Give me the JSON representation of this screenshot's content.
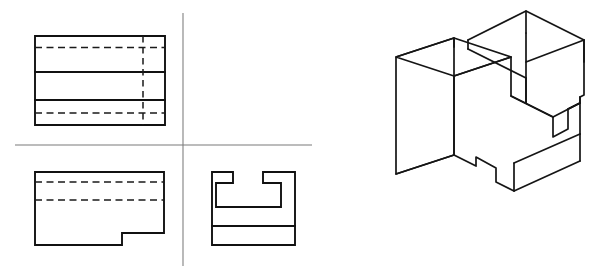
{
  "sheet": {
    "title": "Orthographic Multiview Drawing with Isometric Pictorial",
    "width": 601,
    "height": 278,
    "background_color": "#ffffff",
    "object_line_color": "#111111",
    "hidden_line_color": "#1a1a1a",
    "center_line_color": "#7b7b7b"
  },
  "projection_axes": {
    "name": "quadrant-divider",
    "horizontal": {
      "x1": 15,
      "y1": 145,
      "x2": 312,
      "y2": 145
    },
    "vertical": {
      "x1": 183,
      "y1": 13,
      "x2": 183,
      "y2": 266
    }
  },
  "views": {
    "top_view": {
      "label": "Top View",
      "outline": "M35,36 L165,36 L165,125 L35,125 Z",
      "object_lines": [
        "M35,72 L165,72",
        "M35,100 L165,100"
      ],
      "hidden_lines": [
        "M35,47.5 L165,47.5",
        "M35,113 L165,113"
      ],
      "hidden_lines_vertical": [
        "M143,36 L143,125"
      ],
      "bounds": {
        "x": 35,
        "y": 36,
        "width": 130,
        "height": 89
      }
    },
    "front_view": {
      "label": "Front View",
      "outline": "M35,172 L164,172 L164,233 L122,233 L122,245 L35,245 Z",
      "object_lines": [],
      "hidden_lines": [
        "M35,182 L164,182",
        "M35,200 L164,200"
      ],
      "hidden_lines_vertical": [],
      "bounds": {
        "x": 35,
        "y": 172,
        "width": 129,
        "height": 73
      }
    },
    "side_view": {
      "label": "Right Side View",
      "outline": "M212,172 L233,172 L233,183 L216,183 L216,207 L281,207 L281,183 L263,183 L263,172 L295,172 L295,245 L212,245 Z",
      "object_lines": [
        "M212,226 L295,226"
      ],
      "hidden_lines": [],
      "hidden_lines_vertical": [],
      "bounds": {
        "x": 212,
        "y": 172,
        "width": 83,
        "height": 73
      }
    },
    "isometric_view": {
      "label": "Isometric Pictorial View",
      "bounds": {
        "x": 396,
        "y": 10,
        "width": 190,
        "height": 190
      },
      "paths": [
        "M396,57 L454,38 L454,155 L396,174 Z",
        "M396,57 L454,38 L511,57 L454,76 Z",
        "M454,76 L454,155",
        "M396,174 L454,155",
        "M454,155 L476,166 L476,157 L496,168 L496,182 L514,191 L514,163",
        "M514,163 L580,134",
        "M580,134 L580,97",
        "M454,38 L454,47",
        "M468,40 L468,49",
        "M468,40 L526,11 L584,40 L584,62",
        "M526,11 L526,33",
        "M584,40 L526,62 L526,33",
        "M526,62 L526,103",
        "M468,49 L526,78",
        "M526,78 L526,103",
        "M511,57 L511,96 L553,117 L553,137 L568,129 L568,109 L580,103",
        "M553,117 L580,103",
        "M511,96 L553,117",
        "M454,76 L511,57",
        "M514,191 L580,161",
        "M580,161 L580,134",
        "M580,97 L584,95 L584,40",
        "M568,109 L580,103 L580,97"
      ]
    }
  },
  "annotations": {
    "visible_text": []
  }
}
